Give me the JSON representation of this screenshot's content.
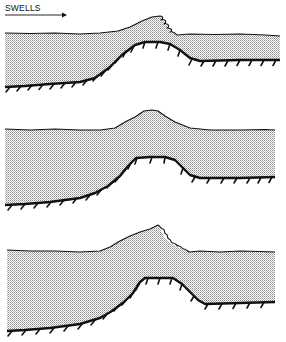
{
  "figure": {
    "direction_label": "SWELLS",
    "arrow": "right-arrow",
    "colors": {
      "ink": "#111111",
      "water_dots": "#9a9a9a",
      "background": "#ffffff"
    },
    "panels": [
      {
        "id": "panel-1",
        "description": "Swell breaking (plunging curl) over rising seabed slope"
      },
      {
        "id": "panel-2",
        "description": "Swell peaking over shoal plateau without breaking"
      },
      {
        "id": "panel-3",
        "description": "Swell breaking (spilling curl) over shoal plateau"
      }
    ]
  }
}
